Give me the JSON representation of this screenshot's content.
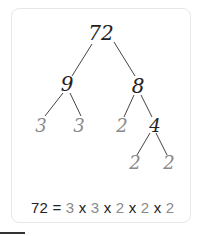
{
  "diagram": {
    "colors": {
      "composite": "#222222",
      "prime": "#8a8a8a",
      "line": "#444444",
      "card_border": "#e6e6e6"
    },
    "nodes": {
      "root": "72",
      "left": "9",
      "right": "8",
      "left_left": "3",
      "left_right": "3",
      "right_left": "2",
      "right_right": "4",
      "right_right_left": "2",
      "right_right_right": "2"
    },
    "equation": {
      "lhs": "72",
      "equals": "=",
      "factors": [
        "3",
        "3",
        "2",
        "2",
        "2"
      ],
      "operator": "x"
    }
  }
}
